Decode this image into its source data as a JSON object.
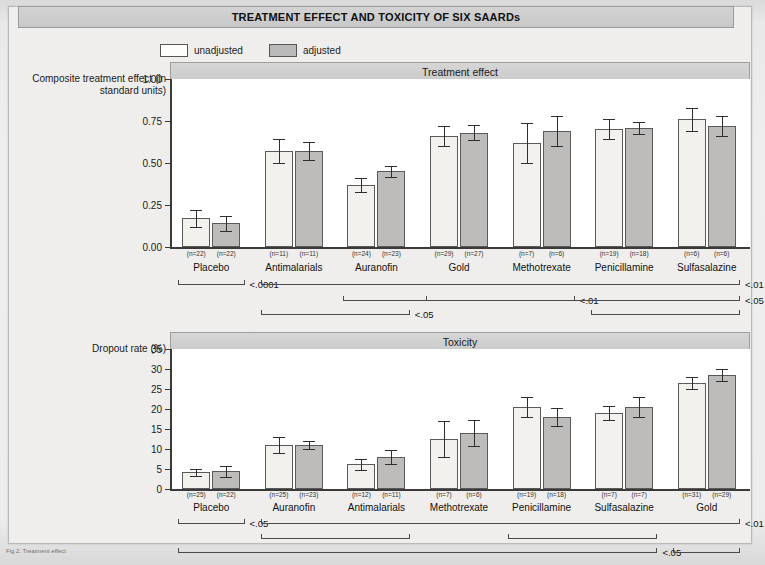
{
  "figure": {
    "title": "TREATMENT EFFECT AND TOXICITY OF SIX SAARDs",
    "caption": "Fig 2. Treatment effect"
  },
  "legend": {
    "items": [
      {
        "key": "unadjusted",
        "label": "unadjusted",
        "color": "#f2f1ee"
      },
      {
        "key": "adjusted",
        "label": "adjusted",
        "color": "#bdbcba"
      }
    ]
  },
  "chart_data": [
    {
      "type": "bar",
      "title": "Treatment effect",
      "ylabel": "Composite treatment effect (in standard units)",
      "xlabel": "",
      "ylim": [
        0.0,
        1.0
      ],
      "yticks": [
        "0.00",
        "0.25",
        "0.50",
        "0.75",
        "1.00"
      ],
      "ytick_values": [
        0.0,
        0.25,
        0.5,
        0.75,
        1.0
      ],
      "grid": false,
      "legend_position": "top-left",
      "categories": [
        "Placebo",
        "Antimalarials",
        "Auranofin",
        "Gold",
        "Methotrexate",
        "Penicillamine",
        "Sulfasalazine"
      ],
      "series": [
        {
          "name": "unadjusted",
          "values": [
            0.17,
            0.57,
            0.37,
            0.66,
            0.62,
            0.7,
            0.76
          ],
          "err_low": [
            0.05,
            0.07,
            0.04,
            0.06,
            0.12,
            0.06,
            0.07
          ],
          "err_high": [
            0.05,
            0.07,
            0.04,
            0.06,
            0.12,
            0.06,
            0.07
          ],
          "n_labels": [
            "(n=22)",
            "(n=11)",
            "(n=24)",
            "(n=29)",
            "(n=7)",
            "(n=19)",
            "(n=6)"
          ]
        },
        {
          "name": "adjusted",
          "values": [
            0.14,
            0.57,
            0.45,
            0.68,
            0.69,
            0.71,
            0.72
          ],
          "err_low": [
            0.045,
            0.055,
            0.035,
            0.045,
            0.09,
            0.035,
            0.06
          ],
          "err_high": [
            0.045,
            0.055,
            0.035,
            0.045,
            0.09,
            0.035,
            0.06
          ],
          "n_labels": [
            "(n=22)",
            "(n=11)",
            "(n=23)",
            "(n=27)",
            "(n=6)",
            "(n=18)",
            "(n=6)"
          ]
        }
      ],
      "significance": [
        {
          "label": "<.0001",
          "from": "Placebo",
          "to": "Placebo",
          "row": 0,
          "side": "right"
        },
        {
          "label": "<.01",
          "from": "Antimalarials",
          "to": "Sulfasalazine",
          "row": 0,
          "side": "right"
        },
        {
          "label": "<.01",
          "from": "Gold",
          "to": "Methotrexate",
          "row": 1,
          "side": "right"
        },
        {
          "label": "<.05",
          "from": "Auranofin",
          "to": "Sulfasalazine",
          "row": 1,
          "side": "right"
        },
        {
          "label": "<.05",
          "from": "Antimalarials",
          "to": "Auranofin",
          "row": 2,
          "side": "right"
        },
        {
          "label": "",
          "from": "Penicillamine",
          "to": "Sulfasalazine",
          "row": 2,
          "side": "right"
        }
      ]
    },
    {
      "type": "bar",
      "title": "Toxicity",
      "ylabel": "Dropout rate (%)",
      "xlabel": "",
      "ylim": [
        0,
        35
      ],
      "yticks": [
        "0",
        "5",
        "10",
        "15",
        "20",
        "25",
        "30",
        "35"
      ],
      "ytick_values": [
        0,
        5,
        10,
        15,
        20,
        25,
        30,
        35
      ],
      "grid": false,
      "legend_position": "top-left",
      "categories": [
        "Placebo",
        "Auranofin",
        "Antimalarials",
        "Methotrexate",
        "Penicillamine",
        "Sulfasalazine",
        "Gold"
      ],
      "series": [
        {
          "name": "unadjusted",
          "values": [
            4.2,
            11.0,
            6.2,
            12.5,
            20.5,
            19.0,
            26.5
          ],
          "err_low": [
            0.9,
            2.1,
            1.4,
            4.6,
            2.6,
            1.8,
            1.6
          ],
          "err_high": [
            0.9,
            2.1,
            1.4,
            4.6,
            2.6,
            1.8,
            1.6
          ],
          "n_labels": [
            "(n=25)",
            "(n=25)",
            "(n=12)",
            "(n=7)",
            "(n=19)",
            "(n=7)",
            "(n=31)"
          ]
        },
        {
          "name": "adjusted",
          "values": [
            4.4,
            11.0,
            8.0,
            14.0,
            18.0,
            20.5,
            28.5
          ],
          "err_low": [
            1.4,
            0.9,
            1.7,
            3.3,
            2.2,
            2.6,
            1.5
          ],
          "err_high": [
            1.4,
            0.9,
            1.7,
            3.3,
            2.2,
            2.6,
            1.5
          ],
          "n_labels": [
            "(n=22)",
            "(n=23)",
            "(n=11)",
            "(n=6)",
            "(n=18)",
            "(n=7)",
            "(n=29)"
          ]
        }
      ],
      "significance": [
        {
          "label": "<.05",
          "from": "Placebo",
          "to": "Placebo",
          "row": 0,
          "side": "right"
        },
        {
          "label": "<.01",
          "from": "Auranofin",
          "to": "Gold",
          "row": 0,
          "side": "right"
        },
        {
          "label": "",
          "from": "Auranofin",
          "to": "Antimalarials",
          "row": 1,
          "side": "right"
        },
        {
          "label": "",
          "from": "Penicillamine",
          "to": "Sulfasalazine",
          "row": 1,
          "side": "right"
        },
        {
          "label": "<.05",
          "from": "Placebo",
          "to": "Sulfasalazine",
          "row": 2,
          "side": "right"
        },
        {
          "label": "",
          "from": "Gold",
          "to": "Gold",
          "row": 2,
          "side": "right"
        }
      ]
    }
  ]
}
